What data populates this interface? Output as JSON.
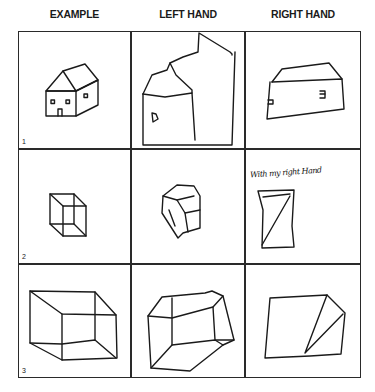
{
  "columns": [
    "EXAMPLE",
    "LEFT HAND",
    "RIGHT HAND"
  ],
  "rows": [
    {
      "number": "1",
      "subject": "house",
      "cells": {
        "example": "house-drawing",
        "left_hand": "house-copy-left",
        "right_hand": "house-copy-right"
      }
    },
    {
      "number": "2",
      "subject": "small-cube",
      "cells": {
        "example": "cube-drawing",
        "left_hand": "cube-copy-left",
        "right_hand": "cube-copy-right"
      },
      "annotation": "With my right Hand"
    },
    {
      "number": "3",
      "subject": "large-cube",
      "cells": {
        "example": "box-drawing",
        "left_hand": "box-copy-left",
        "right_hand": "box-copy-right"
      }
    }
  ]
}
